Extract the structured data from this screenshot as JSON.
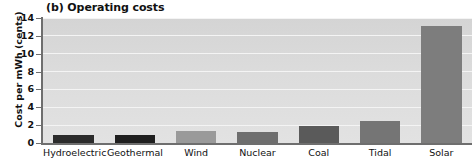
{
  "chart_data": {
    "type": "bar",
    "title": "(b) Operating costs",
    "xlabel": "",
    "ylabel": "Cost per mWh (cents)",
    "categories": [
      "Hydroelectric",
      "Geothermal",
      "Wind",
      "Nuclear",
      "Coal",
      "Tidal",
      "Solar"
    ],
    "values": [
      0.9,
      0.9,
      1.3,
      1.2,
      1.9,
      2.5,
      13.1
    ],
    "ylim": [
      0,
      14
    ],
    "yticks": [
      0,
      2,
      4,
      6,
      8,
      10,
      12,
      14
    ],
    "ytick_labels": [
      "0",
      "2",
      "4",
      "6",
      "8",
      "10",
      "12",
      "14"
    ],
    "grid": true,
    "gridline_color": "#f4f4f4",
    "legend": null,
    "plot_background": "#dcdcdc",
    "bar_colors": [
      "#2b2b2b",
      "#1f1f1f",
      "#9a9a9a",
      "#6e6e6e",
      "#5a5a5a",
      "#757575",
      "#7d7d7d"
    ]
  }
}
